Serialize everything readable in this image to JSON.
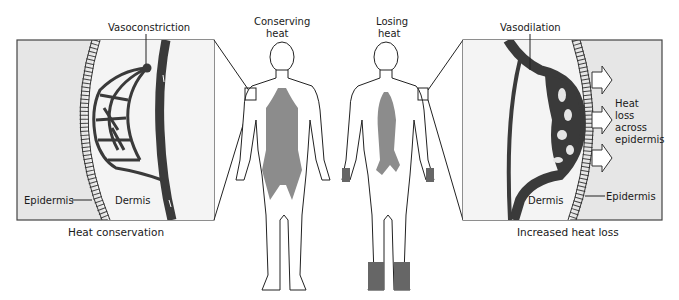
{
  "figure": {
    "left_panel": {
      "labels": {
        "top": "Vasoconstriction",
        "epidermis": "Epidermis",
        "dermis": "Dermis"
      },
      "caption": "Heat conservation"
    },
    "center": {
      "figure_left_title_line1": "Conserving",
      "figure_left_title_line2": "heat",
      "figure_right_title_line1": "Losing",
      "figure_right_title_line2": "heat"
    },
    "right_panel": {
      "labels": {
        "top": "Vasodilation",
        "heat_loss_line1": "Heat",
        "heat_loss_line2": "loss",
        "heat_loss_line3": "across",
        "heat_loss_line4": "epidermis",
        "dermis": "Dermis",
        "epidermis": "Epidermis"
      },
      "caption": "Increased heat loss"
    },
    "colors": {
      "panel_bg": "#e6e6e6",
      "dermis_bg": "#f3f3f3",
      "vessel": "#3a3a3a",
      "shading": "#8c8c8c",
      "line": "#222222"
    }
  }
}
